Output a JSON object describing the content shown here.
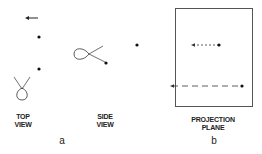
{
  "panels": {
    "a": {
      "letter": "a",
      "top_view": {
        "label_line1": "TOP",
        "label_line2": "VIEW"
      },
      "side_view": {
        "label_line1": "SIDE",
        "label_line2": "VIEW"
      }
    },
    "b": {
      "letter": "b",
      "projection_plane": {
        "label_line1": "PROJECTION",
        "label_line2": "PLANE"
      }
    }
  },
  "colors": {
    "ink": "#222222",
    "background": "#ffffff",
    "box_border": "#555555"
  }
}
